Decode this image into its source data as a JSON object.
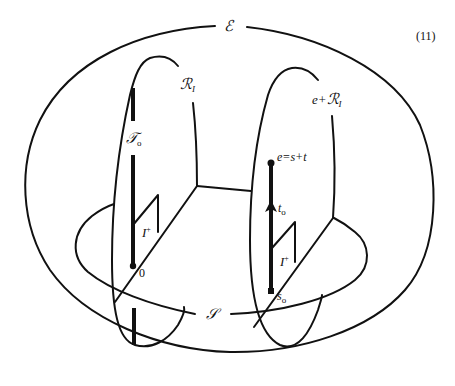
{
  "figure": {
    "equation_number": "(11)",
    "labels": {
      "outer_space": "ℰ",
      "plane": "𝒮",
      "left_region": "ℛ",
      "left_region_sub": "I",
      "right_region_prefix": "e+",
      "right_region": "ℛ",
      "right_region_sub": "I",
      "left_trajectory": "𝒯",
      "left_trajectory_sub": "o",
      "left_interval": "I",
      "left_interval_sup": "+",
      "right_interval": "I",
      "right_interval_sup": "+",
      "origin_point": "0",
      "event_point": "e=s+t",
      "time_vector": "t",
      "time_vector_sub": "o",
      "start_point": "s",
      "start_point_sub": "o"
    },
    "colors": {
      "stroke": "#111111",
      "background": "#ffffff"
    }
  }
}
